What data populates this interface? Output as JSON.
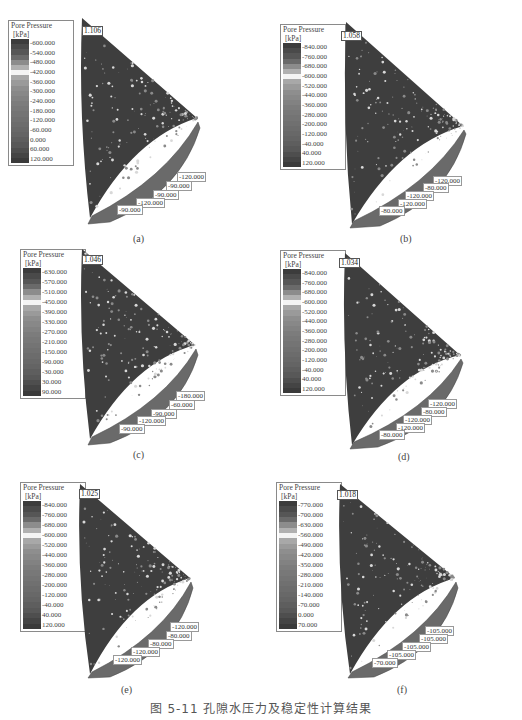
{
  "figure": {
    "caption": "图 5-11   孔隙水压力及稳定性计算结果",
    "panels": [
      {
        "label": "(a)",
        "legend_title": "Pore Pressure",
        "legend_unit": "[kPa]",
        "legend_ticks": [
          "-600.000",
          "-540.000",
          "-480.000",
          "-420.000",
          "-360.000",
          "-300.000",
          "-240.000",
          "-180.000",
          "-120.000",
          "-60.000",
          "0.000",
          "60.000",
          "120.000"
        ],
        "factor_of_safety": "1.106",
        "contour_labels": [
          "-120.000",
          "-90.000",
          "-90.000",
          "-120.000",
          "-90.000"
        ]
      },
      {
        "label": "(b)",
        "legend_title": "Pore Pressure",
        "legend_unit": "[kPa]",
        "legend_ticks": [
          "-840.000",
          "-760.000",
          "-680.000",
          "-600.000",
          "-520.000",
          "-440.000",
          "-360.000",
          "-280.000",
          "-200.000",
          "-120.000",
          "-40.000",
          "40.000",
          "120.000"
        ],
        "factor_of_safety": "1.058",
        "contour_labels": [
          "-120.000",
          "-80.000",
          "-120.000",
          "-120.000",
          "-80.000"
        ]
      },
      {
        "label": "(c)",
        "legend_title": "Pore Pressure",
        "legend_unit": "[kPa]",
        "legend_ticks": [
          "-630.000",
          "-570.000",
          "-510.000",
          "-450.000",
          "-390.000",
          "-330.000",
          "-270.000",
          "-210.000",
          "-150.000",
          "-90.000",
          "-30.000",
          "30.000",
          "90.000"
        ],
        "factor_of_safety": "1.046",
        "contour_labels": [
          "-180.000",
          "-60.000",
          "-90.000",
          "-120.000",
          "-90.000"
        ]
      },
      {
        "label": "(d)",
        "legend_title": "Pore Pressure",
        "legend_unit": "[kPa]",
        "legend_ticks": [
          "-840.000",
          "-760.000",
          "-680.000",
          "-600.000",
          "-520.000",
          "-440.000",
          "-360.000",
          "-280.000",
          "-200.000",
          "-120.000",
          "-40.000",
          "40.000",
          "120.000"
        ],
        "factor_of_safety": "1.034",
        "contour_labels": [
          "-120.000",
          "-80.000",
          "-120.000",
          "-120.000",
          "-80.000"
        ]
      },
      {
        "label": "(e)",
        "legend_title": "Pore Pressure",
        "legend_unit": "[kPa]",
        "legend_ticks": [
          "-840.000",
          "-760.000",
          "-680.000",
          "-600.000",
          "-520.000",
          "-440.000",
          "-360.000",
          "-280.000",
          "-200.000",
          "-120.000",
          "-40.000",
          "40.000",
          "120.000"
        ],
        "factor_of_safety": "1.025",
        "contour_labels": [
          "-120.000",
          "-80.000",
          "-80.000",
          "-120.000",
          "-120.000"
        ]
      },
      {
        "label": "(f)",
        "legend_title": "Pore Pressure",
        "legend_unit": "[kPa]",
        "legend_ticks": [
          "-770.000",
          "-700.000",
          "-630.000",
          "-560.000",
          "-490.000",
          "-420.000",
          "-350.000",
          "-280.000",
          "-210.000",
          "-140.000",
          "-70.000",
          "0.000",
          "70.000"
        ],
        "factor_of_safety": "1.018",
        "contour_labels": [
          "-105.000",
          "-105.000",
          "-105.000",
          "-105.000",
          "-70.000"
        ]
      }
    ]
  },
  "colors": {
    "legend_bands": [
      "#3c3c3c",
      "#4a4a4a",
      "#565656",
      "#6a6a6a",
      "#8c8c8c",
      "#b0b0b0",
      "#f4f4f4",
      "#a8a8a8",
      "#9a9a9a",
      "#8e8e8e",
      "#888888",
      "#828282",
      "#7c7c7c",
      "#787878",
      "#747474",
      "#707070",
      "#6c6c6c",
      "#686868",
      "#646464",
      "#5e5e5e",
      "#585858",
      "#4e4e4e",
      "#444444",
      "#3a3a3a"
    ],
    "slope_fill": "#3e3e3e",
    "band_fill": "#6a6a6a"
  }
}
